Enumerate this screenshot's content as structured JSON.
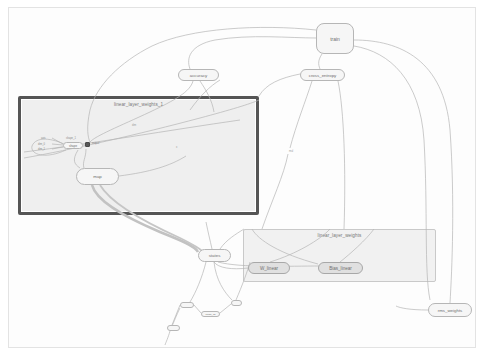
{
  "canvas": {
    "background": "#ffffff",
    "viewport_border": "#e3e3e3"
  },
  "groups": [
    {
      "id": "linear_layer_weights_1",
      "label": "linear_layer_weights_1",
      "style": "strong",
      "border_color": "#555555",
      "fill": "#efefef",
      "x": 18,
      "y": 96,
      "w": 241,
      "h": 119
    },
    {
      "id": "linear_layer_weights",
      "label": "linear_layer_weights",
      "style": "faint",
      "border_color": "#c9c9c9",
      "fill": "#f1f1f1",
      "x": 243,
      "y": 229,
      "w": 193,
      "h": 53
    }
  ],
  "nodes": [
    {
      "id": "train",
      "label": "train",
      "kind": "large",
      "x": 316,
      "y": 23,
      "w": 38,
      "h": 31
    },
    {
      "id": "accuracy",
      "label": "accuracy",
      "kind": "pill",
      "x": 178,
      "y": 69,
      "w": 41,
      "h": 12
    },
    {
      "id": "cross_entropy",
      "label": "cross_entropy",
      "kind": "pill",
      "x": 300,
      "y": 69,
      "w": 45,
      "h": 12
    },
    {
      "id": "map",
      "label": "map",
      "kind": "pill",
      "x": 76,
      "y": 168,
      "w": 43,
      "h": 17
    },
    {
      "id": "states",
      "label": "states",
      "kind": "pill",
      "x": 198,
      "y": 249,
      "w": 33,
      "h": 13
    },
    {
      "id": "W_linear",
      "label": "W_linear",
      "kind": "var",
      "x": 248,
      "y": 262,
      "w": 42,
      "h": 12
    },
    {
      "id": "Bias_linear",
      "label": "Bias_linear",
      "kind": "var",
      "x": 318,
      "y": 262,
      "w": 45,
      "h": 12
    },
    {
      "id": "rms_weights",
      "label": "rms_weights",
      "kind": "pill",
      "x": 428,
      "y": 303,
      "w": 44,
      "h": 14
    },
    {
      "id": "shape",
      "label": "shape",
      "kind": "tiny",
      "x": 63,
      "y": 142,
      "w": 20,
      "h": 7
    },
    {
      "id": "sub_small",
      "label": "",
      "kind": "micro",
      "x": 167,
      "y": 325,
      "w": 13,
      "h": 6
    },
    {
      "id": "rank_small",
      "label": "",
      "kind": "micro",
      "x": 180,
      "y": 302,
      "w": 14,
      "h": 6
    },
    {
      "id": "range_small",
      "label": "range_as",
      "kind": "micro",
      "x": 201,
      "y": 311,
      "w": 19,
      "h": 6
    },
    {
      "id": "concat_small",
      "label": "",
      "kind": "micro",
      "x": 231,
      "y": 300,
      "w": 11,
      "h": 6
    }
  ],
  "chips": [
    {
      "id": "output-chip",
      "x": 85,
      "y": 142,
      "w": 5,
      "h": 5,
      "color": "#585858"
    }
  ],
  "chip_labels": [
    {
      "id": "output-chip-label",
      "text": "output",
      "x": 92,
      "y": 142
    }
  ],
  "port_labels": [
    {
      "id": "port-axis",
      "text": "axis",
      "x": 41,
      "y": 137
    },
    {
      "id": "port-dim-0",
      "text": "dim_0",
      "x": 38,
      "y": 143
    },
    {
      "id": "port-dim-1",
      "text": "dim_1",
      "x": 38,
      "y": 148
    },
    {
      "id": "port-shape",
      "text": "shape_1",
      "x": 66,
      "y": 137
    }
  ],
  "edge_labels": [
    {
      "id": "edge-label-mul",
      "text": "mul",
      "x": 289,
      "y": 150
    },
    {
      "id": "edge-label-dim",
      "text": "dim",
      "x": 132,
      "y": 124
    },
    {
      "id": "edge-label-x",
      "text": "x",
      "x": 176,
      "y": 146
    }
  ],
  "colors": {
    "node_fill": "#f6f6f6",
    "node_border": "#b6b6b6",
    "var_fill": "#e0e0e0",
    "edge": "#b0b0b0",
    "edge_thick": "#c0c0c0",
    "text": "#6f6f6f",
    "group_label_text": "#777777"
  }
}
